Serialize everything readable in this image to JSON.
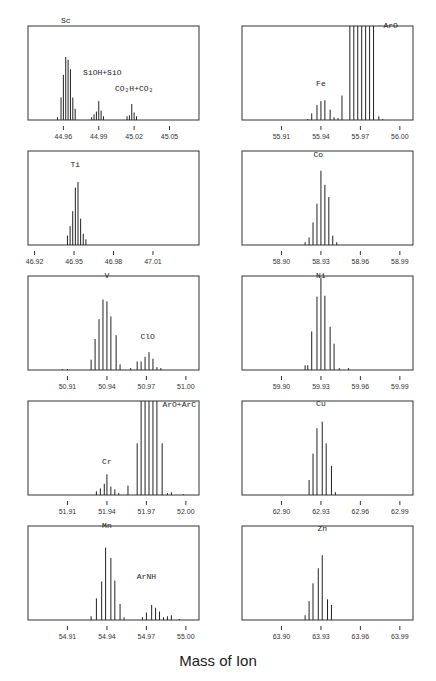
{
  "figure": {
    "xlabel": "Mass of Ion",
    "layout": {
      "columns": 2,
      "rows": 5
    }
  },
  "chart_data": [
    {
      "type": "bar",
      "title": "Sc",
      "position": {
        "row": 0,
        "col": 0
      },
      "xlim": [
        44.93,
        45.075
      ],
      "xticks": [
        44.96,
        44.99,
        45.02,
        45.05
      ],
      "xtick_labels": [
        "44.96",
        "44.99",
        "45.02",
        "45.05"
      ],
      "ylim": [
        0,
        100
      ],
      "annotations": [
        {
          "text": "Sc",
          "x": 44.962,
          "y": 100
        },
        {
          "text": "SiOH+SiO",
          "x": 44.993,
          "y": 45
        },
        {
          "text": "CO₂H+CO₂",
          "x": 45.02,
          "y": 28
        }
      ],
      "series": [
        {
          "name": "Sc",
          "x": [
            44.955,
            44.958,
            44.96,
            44.962,
            44.964,
            44.966,
            44.968,
            44.97
          ],
          "values": [
            3,
            24,
            48,
            67,
            64,
            54,
            24,
            12
          ]
        },
        {
          "name": "SiOH+SiO",
          "x": [
            44.984,
            44.986,
            44.988,
            44.99,
            44.992,
            44.994
          ],
          "values": [
            3,
            6,
            9,
            20,
            10,
            4
          ]
        },
        {
          "name": "CO2H+CO2",
          "x": [
            45.014,
            45.016,
            45.018,
            45.02,
            45.022
          ],
          "values": [
            4,
            5,
            17,
            8,
            4
          ]
        }
      ]
    },
    {
      "type": "bar",
      "title": "ArO",
      "position": {
        "row": 0,
        "col": 1
      },
      "xlim": [
        55.88,
        56.01
      ],
      "xticks": [
        55.91,
        55.94,
        55.97,
        56.0
      ],
      "xtick_labels": [
        "55.91",
        "55.94",
        "55.97",
        "56.00"
      ],
      "ylim": [
        0,
        100
      ],
      "annotations": [
        {
          "text": "Fe",
          "x": 55.94,
          "y": 33
        },
        {
          "text": "ArO",
          "x": 55.993,
          "y": 95
        }
      ],
      "series": [
        {
          "name": "Fe",
          "x": [
            55.93,
            55.933,
            55.937,
            55.94,
            55.943,
            55.947,
            55.95,
            55.953
          ],
          "values": [
            1,
            7,
            16,
            20,
            21,
            11,
            3,
            2
          ]
        },
        {
          "name": "ArO",
          "x": [
            55.956,
            55.962,
            55.965,
            55.968,
            55.971,
            55.974,
            55.977,
            55.98,
            55.984,
            55.987
          ],
          "values": [
            26,
            100,
            100,
            100,
            100,
            100,
            100,
            100,
            4,
            1
          ]
        }
      ]
    },
    {
      "type": "bar",
      "title": "Ti",
      "position": {
        "row": 1,
        "col": 0
      },
      "xlim": [
        46.915,
        47.045
      ],
      "xticks": [
        46.92,
        46.95,
        46.98,
        47.01
      ],
      "xtick_labels": [
        "46.92",
        "46.95",
        "46.98",
        "47.01"
      ],
      "ylim": [
        0,
        100
      ],
      "annotations": [
        {
          "text": "Ti",
          "x": 46.951,
          "y": 80
        }
      ],
      "series": [
        {
          "name": "Ti",
          "x": [
            46.945,
            46.947,
            46.949,
            46.951,
            46.953,
            46.955,
            46.957,
            46.959
          ],
          "values": [
            10,
            20,
            36,
            61,
            67,
            28,
            12,
            6
          ]
        }
      ]
    },
    {
      "type": "bar",
      "title": "Co",
      "position": {
        "row": 1,
        "col": 1
      },
      "xlim": [
        58.87,
        59.0
      ],
      "xticks": [
        58.9,
        58.93,
        58.96,
        58.99
      ],
      "xtick_labels": [
        "58.90",
        "58.93",
        "58.96",
        "58.99"
      ],
      "ylim": [
        0,
        100
      ],
      "annotations": [
        {
          "text": "Co",
          "x": 58.928,
          "y": 90
        }
      ],
      "series": [
        {
          "name": "Co",
          "x": [
            58.918,
            58.921,
            58.924,
            58.927,
            58.93,
            58.933,
            58.936,
            58.939,
            58.942
          ],
          "values": [
            3,
            8,
            24,
            44,
            79,
            64,
            51,
            10,
            3
          ]
        }
      ]
    },
    {
      "type": "bar",
      "title": "V",
      "position": {
        "row": 2,
        "col": 0
      },
      "xlim": [
        50.88,
        51.01
      ],
      "xticks": [
        50.91,
        50.94,
        50.97,
        51.0
      ],
      "xtick_labels": [
        "50.91",
        "50.94",
        "50.97",
        "51.00"
      ],
      "ylim": [
        0,
        100
      ],
      "annotations": [
        {
          "text": "V",
          "x": 50.94,
          "y": 95
        },
        {
          "text": "ClO",
          "x": 50.971,
          "y": 30
        }
      ],
      "series": [
        {
          "name": "V",
          "x": [
            50.906,
            50.91,
            50.928,
            50.931,
            50.934,
            50.937,
            50.94,
            50.943,
            50.947,
            50.95
          ],
          "values": [
            1,
            1,
            11,
            33,
            54,
            75,
            73,
            57,
            37,
            6
          ]
        },
        {
          "name": "ClO",
          "x": [
            50.958,
            50.963,
            50.966,
            50.969,
            50.972,
            50.975,
            50.978,
            50.981
          ],
          "values": [
            2,
            9,
            9,
            14,
            19,
            12,
            3,
            2
          ]
        }
      ]
    },
    {
      "type": "bar",
      "title": "Ni",
      "position": {
        "row": 2,
        "col": 1
      },
      "xlim": [
        59.87,
        60.0
      ],
      "xticks": [
        59.9,
        59.93,
        59.96,
        59.99
      ],
      "xtick_labels": [
        "59.90",
        "59.93",
        "59.96",
        "59.99"
      ],
      "ylim": [
        0,
        100
      ],
      "annotations": [
        {
          "text": "Ni",
          "x": 59.93,
          "y": 95
        }
      ],
      "series": [
        {
          "name": "Ni",
          "x": [
            59.918,
            59.92,
            59.923,
            59.927,
            59.93,
            59.933,
            59.937,
            59.94,
            59.944,
            59.951
          ],
          "values": [
            5,
            5,
            41,
            78,
            98,
            79,
            46,
            28,
            2,
            2
          ]
        }
      ]
    },
    {
      "type": "bar",
      "title": "ArO+ArC",
      "position": {
        "row": 3,
        "col": 0
      },
      "xlim": [
        51.88,
        52.01
      ],
      "xticks": [
        51.91,
        51.94,
        51.97,
        52.0
      ],
      "xtick_labels": [
        "51.91",
        "51.94",
        "51.97",
        "52.00"
      ],
      "ylim": [
        0,
        100
      ],
      "annotations": [
        {
          "text": "Cr",
          "x": 51.94,
          "y": 30
        },
        {
          "text": "ArO+ArC",
          "x": 51.995,
          "y": 90
        }
      ],
      "series": [
        {
          "name": "Cr",
          "x": [
            51.932,
            51.935,
            51.938,
            51.94,
            51.943,
            51.946,
            51.949
          ],
          "values": [
            4,
            7,
            12,
            22,
            9,
            6,
            2
          ]
        },
        {
          "name": "ArO+ArC",
          "x": [
            51.956,
            51.963,
            51.966,
            51.969,
            51.972,
            51.975,
            51.978,
            51.982,
            51.986,
            51.989,
            51.998
          ],
          "values": [
            10,
            55,
            100,
            100,
            100,
            100,
            100,
            55,
            2,
            3,
            1
          ]
        }
      ]
    },
    {
      "type": "bar",
      "title": "Cu",
      "position": {
        "row": 3,
        "col": 1
      },
      "xlim": [
        62.87,
        63.0
      ],
      "xticks": [
        62.9,
        62.93,
        62.96,
        62.99
      ],
      "xtick_labels": [
        "62.90",
        "62.93",
        "62.96",
        "62.99"
      ],
      "ylim": [
        0,
        100
      ],
      "annotations": [
        {
          "text": "Cu",
          "x": 62.93,
          "y": 92
        }
      ],
      "series": [
        {
          "name": "Cu",
          "x": [
            62.921,
            62.924,
            62.927,
            62.931,
            62.934,
            62.938,
            62.941
          ],
          "values": [
            16,
            44,
            71,
            78,
            55,
            31,
            3
          ]
        }
      ]
    },
    {
      "type": "bar",
      "title": "Mn",
      "position": {
        "row": 4,
        "col": 0
      },
      "xlim": [
        54.88,
        55.01
      ],
      "xticks": [
        54.91,
        54.94,
        54.97,
        55.0
      ],
      "xtick_labels": [
        "54.91",
        "54.94",
        "54.97",
        "55.00"
      ],
      "ylim": [
        0,
        100
      ],
      "annotations": [
        {
          "text": "Mn",
          "x": 54.94,
          "y": 95
        },
        {
          "text": "ArNH",
          "x": 54.97,
          "y": 40
        }
      ],
      "series": [
        {
          "name": "Mn",
          "x": [
            54.928,
            54.932,
            54.936,
            54.939,
            54.943,
            54.946,
            54.95,
            54.953
          ],
          "values": [
            4,
            23,
            41,
            77,
            66,
            42,
            17,
            3
          ]
        },
        {
          "name": "ArNH",
          "x": [
            54.967,
            54.97,
            54.974,
            54.977,
            54.98,
            54.983,
            54.986,
            54.989,
            54.995
          ],
          "values": [
            3,
            8,
            16,
            13,
            9,
            3,
            4,
            5,
            1
          ]
        }
      ]
    },
    {
      "type": "bar",
      "title": "Zn",
      "position": {
        "row": 4,
        "col": 1
      },
      "xlim": [
        63.87,
        64.0
      ],
      "xticks": [
        63.9,
        63.93,
        63.96,
        63.99
      ],
      "xtick_labels": [
        "63.90",
        "63.93",
        "63.96",
        "63.99"
      ],
      "ylim": [
        0,
        100
      ],
      "annotations": [
        {
          "text": "Zn",
          "x": 63.931,
          "y": 92
        }
      ],
      "series": [
        {
          "name": "Zn",
          "x": [
            63.918,
            63.921,
            63.924,
            63.928,
            63.931,
            63.935,
            63.938
          ],
          "values": [
            5,
            20,
            39,
            55,
            69,
            22,
            16
          ]
        }
      ]
    }
  ]
}
